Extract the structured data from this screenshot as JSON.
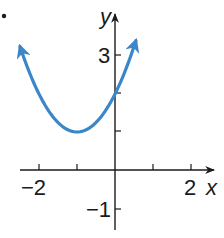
{
  "chart_data": {
    "type": "line",
    "title": "",
    "problem_marker": ".",
    "xlabel": "x",
    "ylabel": "y",
    "xlim": [
      -2.5,
      2.6
    ],
    "ylim": [
      -1.5,
      4.2
    ],
    "grid": false,
    "x_ticks": [
      -2,
      -1,
      1,
      2
    ],
    "x_tick_labels": [
      "-2",
      "",
      "",
      "2"
    ],
    "y_ticks": [
      -1,
      1,
      2,
      3
    ],
    "y_tick_labels": [
      "-1",
      "",
      "",
      "3"
    ],
    "series": [
      {
        "name": "parabola",
        "equation": "y = (x + 1)^2 + 1",
        "vertex": [
          -1,
          1
        ],
        "y_intercept": [
          0,
          2
        ],
        "x_range": [
          -2.5,
          0.55
        ],
        "arrows_both_ends": true,
        "color": "#3a86c8",
        "x": [
          -2.5,
          -2,
          -1.5,
          -1,
          -0.5,
          0,
          0.55
        ],
        "y": [
          3.25,
          2,
          1.25,
          1,
          1.25,
          2,
          3.4
        ]
      }
    ]
  },
  "labels": {
    "marker": "•",
    "x_axis": "x",
    "y_axis": "y",
    "tick_x_neg2": "−2",
    "tick_x_2": "2",
    "tick_y_3": "3",
    "tick_y_neg1": "−1"
  }
}
